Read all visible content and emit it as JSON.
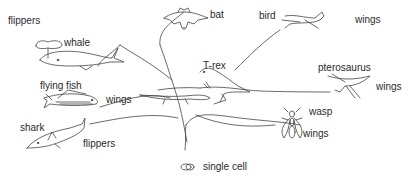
{
  "diagram": {
    "type": "evolutionary-tree",
    "root": {
      "label": "single cell",
      "icon": "cell-icon"
    },
    "labels": {
      "flippers_top": "flippers",
      "whale": "whale",
      "flying_fish": "flying fish",
      "wings_fish": "wings",
      "shark": "shark",
      "flippers_shark": "flippers",
      "bat": "bat",
      "bird": "bird",
      "wings_bird": "wings",
      "trex": "T-rex",
      "pterosaurus": "pterosaurus",
      "wings_ptero": "wings",
      "wasp": "wasp",
      "wings_wasp": "wings",
      "single_cell": "single cell"
    },
    "colors": {
      "line": "#444444",
      "text": "#2a2a2a",
      "background": "#ffffff"
    }
  }
}
